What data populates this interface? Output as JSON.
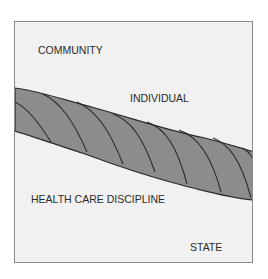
{
  "diagram": {
    "labels": {
      "community": "COMMUNITY",
      "individual": "INDIVIDUAL",
      "health_care_discipline": "HEALTH CARE DISCIPLINE",
      "state": "STATE"
    },
    "colors": {
      "background": "#f1f1f1",
      "rope_fill": "#8c8c8c",
      "rope_stroke": "#2a2a2a",
      "border": "#8a8a8a"
    }
  }
}
